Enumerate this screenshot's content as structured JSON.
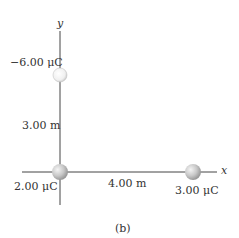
{
  "axes": {
    "x_label": "x",
    "y_label": "y"
  },
  "charges": [
    {
      "label": "−6.00 μC",
      "position": "top on y-axis"
    },
    {
      "label": "2.00 μC",
      "position": "origin"
    },
    {
      "label": "3.00 μC",
      "position": "right on x-axis"
    }
  ],
  "distances": {
    "vertical": "3.00 m",
    "horizontal": "4.00 m"
  },
  "caption": "(b)"
}
